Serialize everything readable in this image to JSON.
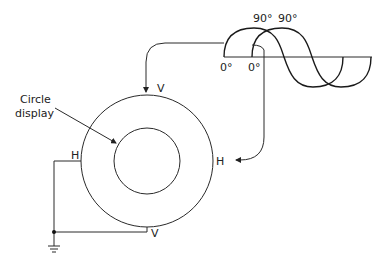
{
  "diagram": {
    "type": "lissajous-circle-display",
    "labels": {
      "callout": [
        "Circle",
        "display"
      ],
      "top_input": "V",
      "right_input": "H",
      "left_input": "H",
      "bottom_input": "V"
    },
    "waveforms": {
      "wave1_start_label": "0°",
      "wave2_start_label": "0°",
      "wave1_peak_label": "90°",
      "wave2_peak_label": "90°",
      "phase_shift_deg": 90
    },
    "colors": {
      "stroke": "#2a2a2a",
      "background": "#ffffff"
    }
  }
}
